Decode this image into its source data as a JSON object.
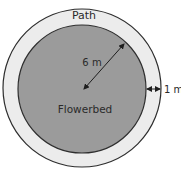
{
  "diagram": {
    "type": "concentric-circles",
    "labels": {
      "path": "Path",
      "flowerbed": "Flowerbed",
      "radius": "6 m",
      "path_width": "1 m"
    },
    "colors": {
      "flowerbed_fill": "#9b9b9b",
      "path_fill": "#ececec",
      "stroke": "#2e2e2e",
      "background": "#ffffff"
    },
    "measurements": {
      "flowerbed_radius_m": 6,
      "path_width_m": 1
    }
  }
}
